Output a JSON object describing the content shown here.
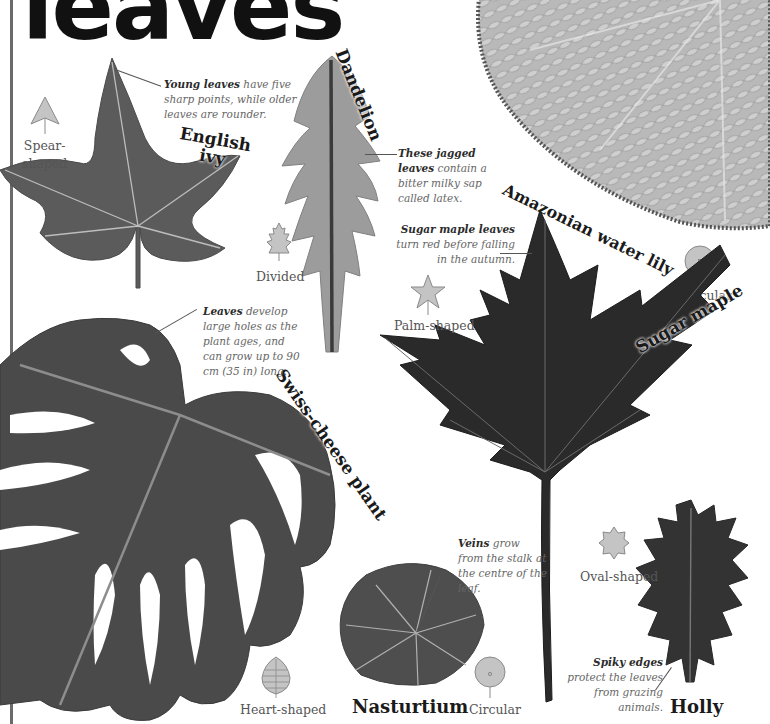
{
  "page": {
    "title": "leaves",
    "accent_rule_color": "#6b6b6b"
  },
  "leaves": {
    "english_ivy": {
      "name_line1": "English",
      "name_line2": "ivy",
      "caption_bold": "Young leaves",
      "caption_rest": " have five sharp points, while older leaves are rounder.",
      "shape_icon": "spear-shape-icon",
      "shape_label_line1": "Spear-",
      "shape_label_line2": "shaped"
    },
    "dandelion": {
      "name": "Dandelion",
      "caption_bold": "These jagged leaves",
      "caption_rest": " contain a bitter milky sap called latex.",
      "shape_icon": "divided-shape-icon",
      "shape_label": "Divided"
    },
    "amazonian_water_lily": {
      "name": "Amazonian water lily",
      "shape_icon": "circular-shape-icon",
      "shape_label": "Circular"
    },
    "sugar_maple": {
      "name": "Sugar maple",
      "caption_bold": "Sugar maple leaves",
      "caption_rest": " turn red before falling in the autumn.",
      "shape_icon": "palm-shape-icon",
      "shape_label": "Palm-shaped"
    },
    "swiss_cheese_plant": {
      "name": "Swiss-cheese plant",
      "caption_bold": "Leaves",
      "caption_rest": " develop large holes as the plant ages, and can grow up to 90 cm (35 in) long.",
      "shape_icon": "heart-shape-icon",
      "shape_label": "Heart-shaped"
    },
    "nasturtium": {
      "name": "Nasturtium",
      "caption_bold": "Veins",
      "caption_rest": " grow from the stalk at the centre of the leaf.",
      "shape_icon": "circular-shape-icon",
      "shape_label": "Circular"
    },
    "holly": {
      "name": "Holly",
      "caption_bold": "Spiky edges",
      "caption_rest": " protect the leaves from grazing animals.",
      "shape_icon": "oval-shape-icon",
      "shape_label": "Oval-shaped"
    }
  },
  "colors": {
    "icon_fill": "#c4c4c4",
    "icon_stroke": "#8a8a8a",
    "caption_text": "#666666",
    "name_text": "#1a1a1a"
  }
}
